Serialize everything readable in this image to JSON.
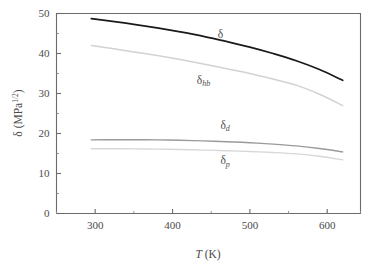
{
  "chart_data": {
    "type": "line",
    "title": "",
    "xlabel": "T (K)",
    "ylabel": "δ (MPa1/2)",
    "ylabel_base": "δ (MPa",
    "ylabel_exp": "1/2",
    "ylabel_tail": ")",
    "xlabel_italic": "T",
    "xlabel_unit": " (K)",
    "xlim": [
      250,
      643
    ],
    "ylim": [
      0,
      50
    ],
    "grid": false,
    "legend": "inline-curve-labels",
    "xticks": [
      300,
      400,
      500,
      600
    ],
    "xticklabels": [
      "300",
      "400",
      "500",
      "600"
    ],
    "xminorticks": [
      250,
      350,
      450,
      550,
      600,
      643
    ],
    "yticks": [
      0,
      10,
      20,
      30,
      40,
      50
    ],
    "yticklabels": [
      "0",
      "10",
      "20",
      "30",
      "40",
      "50"
    ],
    "yminorticks": [
      5,
      15,
      25,
      35,
      45
    ],
    "x": [
      295,
      320,
      350,
      380,
      410,
      440,
      470,
      500,
      530,
      560,
      590,
      620
    ],
    "series": [
      {
        "name": "δ",
        "label_symbol": "δ",
        "label_sub": "",
        "color": "#1a1a1a",
        "width": 1.7,
        "values": [
          48.7,
          48.1,
          47.3,
          46.4,
          45.4,
          44.3,
          43.0,
          41.6,
          40.0,
          38.2,
          36.0,
          33.3
        ]
      },
      {
        "name": "δhb",
        "label_symbol": "δ",
        "label_sub": "hb",
        "color": "#d2d2d2",
        "width": 1.5,
        "values": [
          42.0,
          41.3,
          40.4,
          39.5,
          38.5,
          37.4,
          36.2,
          35.0,
          33.6,
          32.1,
          29.8,
          27.0
        ]
      },
      {
        "name": "δd",
        "label_symbol": "δ",
        "label_sub": "d",
        "color": "#9a9a9a",
        "width": 1.4,
        "values": [
          18.4,
          18.45,
          18.45,
          18.4,
          18.3,
          18.15,
          17.95,
          17.7,
          17.35,
          16.9,
          16.25,
          15.4
        ]
      },
      {
        "name": "δp",
        "label_symbol": "δ",
        "label_sub": "p",
        "color": "#d7d7d7",
        "width": 1.4,
        "values": [
          16.2,
          16.2,
          16.15,
          16.1,
          16.0,
          15.85,
          15.7,
          15.5,
          15.25,
          14.9,
          14.3,
          13.4
        ]
      }
    ],
    "annotations": [
      {
        "name": "label-delta",
        "text_symbol": "δ",
        "text_sub": "",
        "x": 462,
        "y": 44.0
      },
      {
        "name": "label-delta-hb",
        "text_symbol": "δ",
        "text_sub": "hb",
        "x": 440,
        "y": 32.5
      },
      {
        "name": "label-delta-d",
        "text_symbol": "δ",
        "text_sub": "d",
        "x": 468,
        "y": 21.2
      },
      {
        "name": "label-delta-p",
        "text_symbol": "δ",
        "text_sub": "p",
        "x": 468,
        "y": 12.3
      }
    ]
  }
}
